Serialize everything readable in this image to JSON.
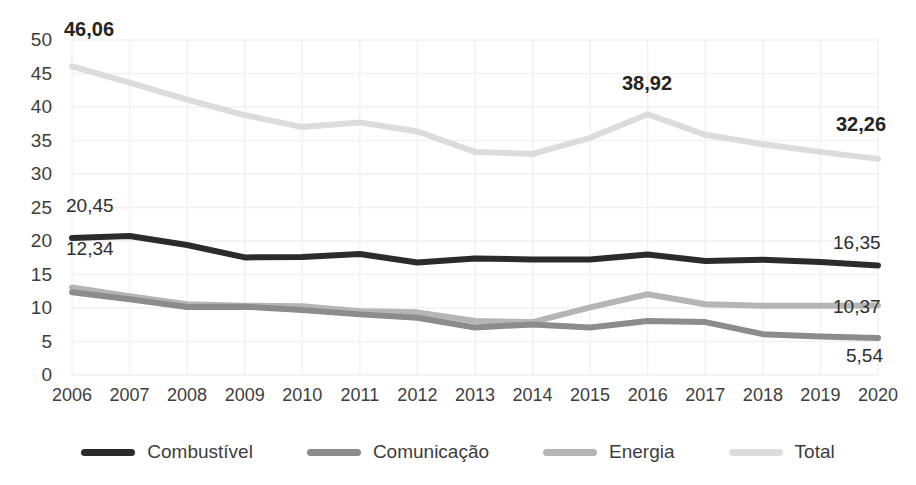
{
  "chart_data": {
    "type": "line",
    "title": "",
    "subtitle": "",
    "xlabel": "",
    "ylabel": "",
    "categories": [
      "2006",
      "2007",
      "2008",
      "2009",
      "2010",
      "2011",
      "2012",
      "2013",
      "2014",
      "2015",
      "2016",
      "2017",
      "2018",
      "2019",
      "2020"
    ],
    "ylim": [
      0,
      50
    ],
    "ytick_step": 5,
    "yticks": [
      "0",
      "5",
      "10",
      "15",
      "20",
      "25",
      "30",
      "35",
      "40",
      "45",
      "50"
    ],
    "grid": true,
    "legend_position": "bottom",
    "series": [
      {
        "name": "Combustível",
        "color": "#2b2b2b",
        "values": [
          20.45,
          20.75,
          19.4,
          17.55,
          17.6,
          18.05,
          16.8,
          17.4,
          17.25,
          17.25,
          18.0,
          17.0,
          17.2,
          16.85,
          16.35
        ]
      },
      {
        "name": "Comunicação",
        "color": "#8c8c8c",
        "values": [
          12.34,
          11.3,
          10.15,
          10.2,
          9.7,
          9.05,
          8.55,
          7.1,
          7.55,
          7.1,
          8.05,
          7.9,
          6.1,
          5.75,
          5.54
        ]
      },
      {
        "name": "Energia",
        "color": "#b5b5b5",
        "values": [
          13.05,
          11.75,
          10.55,
          10.35,
          10.25,
          9.5,
          9.35,
          8.05,
          7.9,
          10.1,
          12.05,
          10.55,
          10.35,
          10.35,
          10.37
        ]
      },
      {
        "name": "Total",
        "color": "#dcdcdc",
        "values": [
          46.06,
          43.65,
          41.1,
          38.8,
          37.0,
          37.7,
          36.35,
          33.3,
          33.0,
          35.4,
          38.92,
          35.85,
          34.45,
          33.3,
          32.26
        ]
      }
    ],
    "annotations": [
      {
        "text": "46,06",
        "series": "Total",
        "category": "2006",
        "bold": true,
        "x": 64,
        "y": 18
      },
      {
        "text": "38,92",
        "series": "Total",
        "category": "2016",
        "bold": true,
        "x": 622,
        "y": 72
      },
      {
        "text": "32,26",
        "series": "Total",
        "category": "2020",
        "bold": true,
        "x": 836,
        "y": 113
      },
      {
        "text": "20,45",
        "series": "Combustível",
        "category": "2006",
        "bold": false,
        "x": 66,
        "y": 195
      },
      {
        "text": "12,34",
        "series": "Comunicação",
        "category": "2006",
        "bold": false,
        "x": 66,
        "y": 238
      },
      {
        "text": "16,35",
        "series": "Combustível",
        "category": "2020",
        "bold": false,
        "x": 833,
        "y": 232
      },
      {
        "text": "10,37",
        "series": "Energia",
        "category": "2020",
        "bold": false,
        "x": 833,
        "y": 296
      },
      {
        "text": "5,54",
        "series": "Comunicação",
        "category": "2020",
        "bold": false,
        "x": 846,
        "y": 345
      }
    ]
  },
  "legend": {
    "items": [
      {
        "label": "Combustível",
        "color": "#2b2b2b"
      },
      {
        "label": "Comunicação",
        "color": "#8c8c8c"
      },
      {
        "label": "Energia",
        "color": "#b5b5b5"
      },
      {
        "label": "Total",
        "color": "#dcdcdc"
      }
    ]
  },
  "axis": {
    "grid_color": "#f1f1f1"
  }
}
